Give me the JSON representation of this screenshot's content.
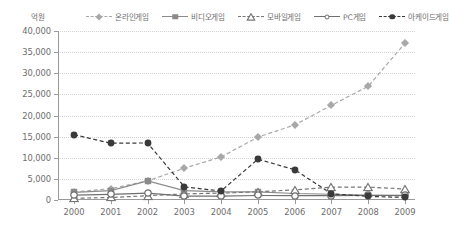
{
  "unit_label": "억원",
  "legend": {
    "position": "top",
    "items": [
      {
        "label": "온라인게임",
        "marker": "diamond",
        "line": "dashed",
        "color": "#a8a8a8"
      },
      {
        "label": "비디오게임",
        "marker": "square",
        "line": "solid",
        "color": "#8a8a8a"
      },
      {
        "label": "모바일게임",
        "marker": "triangle-open",
        "line": "dashed",
        "color": "#777777"
      },
      {
        "label": "PC게임",
        "marker": "circle-open",
        "line": "solid",
        "color": "#6f6f6f"
      },
      {
        "label": "아케이드게임",
        "marker": "circle-filled",
        "line": "dashed",
        "color": "#3a3a3a"
      }
    ]
  },
  "chart_data": {
    "type": "line",
    "title": "",
    "xlabel": "",
    "ylabel": "억원",
    "categories": [
      "2000",
      "2001",
      "2002",
      "2003",
      "2004",
      "2005",
      "2006",
      "2007",
      "2008",
      "2009"
    ],
    "x": [
      2000,
      2001,
      2002,
      2003,
      2004,
      2005,
      2006,
      2007,
      2008,
      2009
    ],
    "ylim": [
      0,
      40000
    ],
    "ytick_labels": [
      "0",
      "5,000",
      "10,000",
      "15,000",
      "20,000",
      "25,000",
      "30,000",
      "35,000",
      "40,000"
    ],
    "ytick_values": [
      0,
      5000,
      10000,
      15000,
      20000,
      25000,
      30000,
      35000,
      40000
    ],
    "grid": true,
    "legend_position": "top",
    "series": [
      {
        "name": "온라인게임",
        "marker": "diamond",
        "line": "dashed",
        "color": "#a8a8a8",
        "values": [
          1915,
          2682,
          4522,
          7541,
          10186,
          14883,
          17768,
          22403,
          26922,
          37087
        ]
      },
      {
        "name": "비디오게임",
        "marker": "square",
        "line": "solid",
        "color": "#8a8a8a",
        "values": [
          1797,
          2239,
          4526,
          2229,
          1939,
          1944,
          1538,
          1366,
          1141,
          1025
        ]
      },
      {
        "name": "모바일게임",
        "marker": "triangle-open",
        "line": "dashed",
        "color": "#777777",
        "values": [
          400,
          600,
          1004,
          1458,
          1617,
          1939,
          2394,
          3050,
          3050,
          2608
        ]
      },
      {
        "name": "PC게임",
        "marker": "circle-open",
        "line": "solid",
        "color": "#6f6f6f",
        "values": [
          1162,
          1350,
          1647,
          938,
          938,
          1069,
          1028,
          1053,
          1071,
          1090
        ]
      },
      {
        "name": "아케이드게임",
        "marker": "circle-filled",
        "line": "dashed",
        "color": "#3a3a3a",
        "values": [
          15469,
          13440,
          13500,
          3118,
          2131,
          9655,
          7171,
          1479,
          856,
          618
        ]
      }
    ]
  }
}
